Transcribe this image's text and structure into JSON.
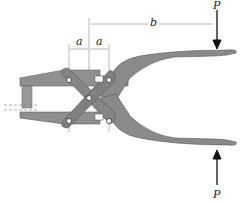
{
  "diagram": {
    "type": "mechanism",
    "labels": {
      "force_top": "P",
      "force_bottom": "P",
      "dim_a_left": "a",
      "dim_a_right": "a",
      "dim_b": "b"
    },
    "colors": {
      "part_fill": "#8a8a8a",
      "part_edge": "#5a5a5a",
      "dim_line": "#888888",
      "arrow": "#111111",
      "pin": "#ffffff"
    }
  }
}
